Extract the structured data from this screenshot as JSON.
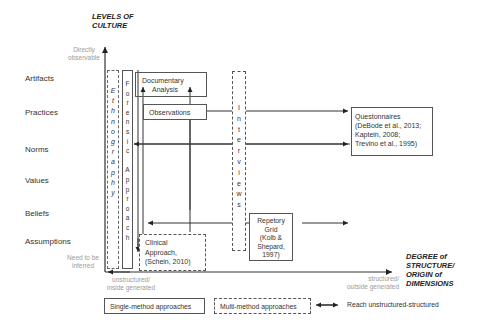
{
  "diagram": {
    "y_axis": {
      "title_line1": "LEVELS OF",
      "title_line2": "CULTURE",
      "top_label_line1": "Directly",
      "top_label_line2": "observable",
      "bottom_label_line1": "Need to be",
      "bottom_label_line2": "inferred"
    },
    "x_axis": {
      "title_line1": "DEGREE of",
      "title_line2": "STRUCTURE/",
      "title_line3": "ORIGIN of",
      "title_line4": "DIMENSIONS",
      "left_label_line1": "unstructured/",
      "left_label_line2": "inside generated",
      "right_label_line1": "structured/",
      "right_label_line2": "outside generated"
    },
    "levels": [
      "Artifacts",
      "Practices",
      "Norms",
      "Values",
      "Beliefs",
      "Assumptions"
    ],
    "methods": {
      "ethnography": [
        "E",
        "t",
        "h",
        "n",
        "o",
        "g",
        "r",
        "a",
        "p",
        "h",
        "y"
      ],
      "forensic_approach": [
        "F",
        "o",
        "r",
        "e",
        "n",
        "s",
        "i",
        "c",
        "",
        "A",
        "p",
        "p",
        "r",
        "o",
        "a",
        "c",
        "h"
      ],
      "interviews": [
        "I",
        "n",
        "t",
        "e",
        "r",
        "v",
        "i",
        "e",
        "w",
        "s"
      ],
      "documentary_analysis_line1": "Documentary",
      "documentary_analysis_line2": "Analysis",
      "observations": "Observations",
      "questionnaires_line1": "Questonnaires",
      "questionnaires_line2": "(DeBode et al., 2013;",
      "questionnaires_line3": "Kaptein, 2008;",
      "questionnaires_line4": "Trevino et al., 1995)",
      "repetory_line1": "Repetory",
      "repetory_line2": "Grid",
      "repetory_line3": "(Kolb &",
      "repetory_line4": "Shepard,",
      "repetory_line5": "1997)",
      "clinical_line1": "Clinical",
      "clinical_line2": "Approach,",
      "clinical_line3": "(Schein, 2010)"
    },
    "legend": {
      "single": "Single-method approaches",
      "multi": "Multi-method approaches",
      "reach": "Reach unstructured-structured"
    }
  }
}
